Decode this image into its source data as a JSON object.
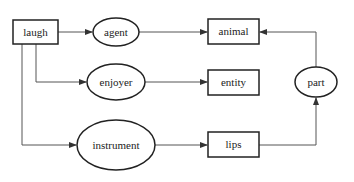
{
  "diagram": {
    "nodes": {
      "laugh": {
        "label": "laugh",
        "shape": "box"
      },
      "agent": {
        "label": "agent",
        "shape": "ellipse"
      },
      "enjoyer": {
        "label": "enjoyer",
        "shape": "ellipse"
      },
      "instrument": {
        "label": "instrument",
        "shape": "ellipse"
      },
      "animal": {
        "label": "animal",
        "shape": "box"
      },
      "entity": {
        "label": "entity",
        "shape": "box"
      },
      "lips": {
        "label": "lips",
        "shape": "box"
      },
      "part": {
        "label": "part",
        "shape": "ellipse"
      }
    },
    "edges": [
      {
        "from": "laugh",
        "to": "agent"
      },
      {
        "from": "agent",
        "to": "animal"
      },
      {
        "from": "laugh",
        "to": "enjoyer"
      },
      {
        "from": "enjoyer",
        "to": "entity"
      },
      {
        "from": "laugh",
        "to": "instrument"
      },
      {
        "from": "instrument",
        "to": "lips"
      },
      {
        "from": "lips",
        "to": "part"
      },
      {
        "from": "part",
        "to": "animal"
      }
    ],
    "colors": {
      "stroke": "#222222",
      "line": "#555555",
      "background": "#ffffff"
    }
  }
}
